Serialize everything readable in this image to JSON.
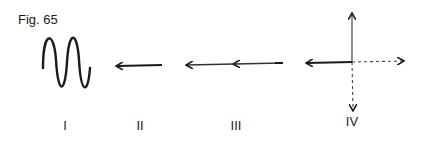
{
  "figure": {
    "title": "Fig. 65",
    "panels": [
      {
        "id": "I",
        "label": "I",
        "content": "sine-wave"
      },
      {
        "id": "II",
        "label": "II",
        "content": "single-arrow-left"
      },
      {
        "id": "III",
        "label": "III",
        "content": "double-arrow-left"
      },
      {
        "id": "IV",
        "label": "IV",
        "content": "cross-arrows"
      }
    ]
  }
}
